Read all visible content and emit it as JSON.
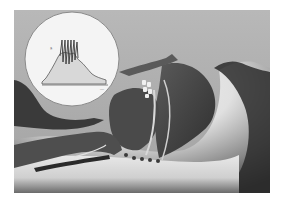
{
  "figure": {
    "colors": {
      "background_top": "#b4b4b4",
      "background_bottom": "#9c9c9c",
      "skin_light": "#e6e6e6",
      "tissue_dark": "#3a3a3a",
      "tissue_mid": "#5c5c5c",
      "inset_fill": "#f4f4f4",
      "waveform_fill": "#d6d6d6",
      "waveform_line": "#4a4a4a"
    }
  },
  "inset": {
    "shape": "circle",
    "y_axis_label": "§",
    "x_axis_label": "—",
    "waveform": {
      "description": "rising envelope with dense oscillation burst then decay",
      "envelope": [
        [
          0,
          0
        ],
        [
          10,
          4
        ],
        [
          20,
          14
        ],
        [
          28,
          22
        ],
        [
          34,
          30
        ],
        [
          40,
          30
        ],
        [
          46,
          30
        ],
        [
          52,
          30
        ],
        [
          58,
          28
        ],
        [
          64,
          20
        ],
        [
          72,
          12
        ],
        [
          80,
          6
        ],
        [
          88,
          2
        ]
      ],
      "oscillation_count": 6
    }
  }
}
